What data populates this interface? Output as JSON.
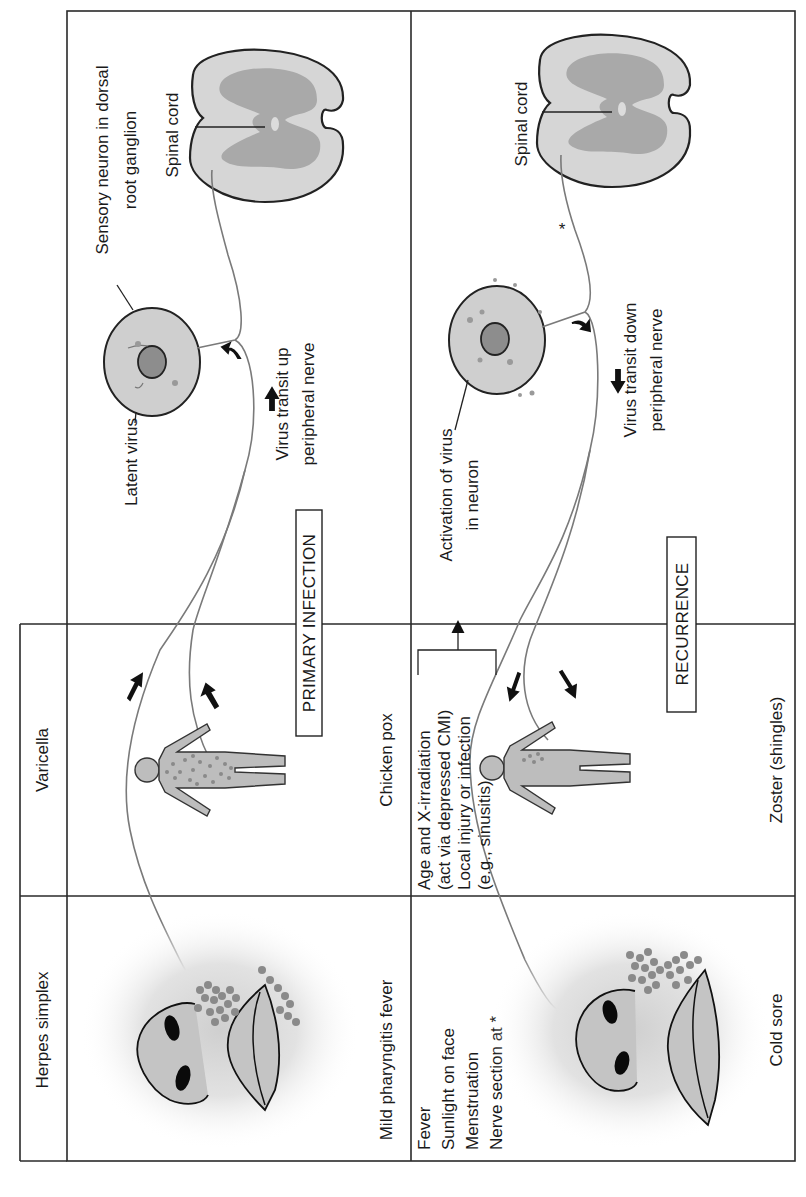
{
  "diagram": {
    "orientation": "rotated-90-ccw",
    "row_headers": {
      "herpes": "Herpes simplex",
      "varicella": "Varicella"
    },
    "section_labels": {
      "primary": "PRIMARY INFECTION",
      "recurrence": "RECURRENCE"
    },
    "primary": {
      "sensory_neuron": "Sensory neuron in dorsal",
      "sensory_neuron_line2": "root ganglion",
      "spinal_cord": "Spinal cord",
      "latent_virus": "Latent virus",
      "transit_up": "Virus transit up",
      "transit_up_line2": "peripheral nerve",
      "varicella_outcome": "Chicken pox",
      "herpes_outcome": "Mild pharyngitis fever"
    },
    "recurrence": {
      "spinal_cord": "Spinal cord",
      "nerve_section_marker": "*",
      "activation": "Activation of virus",
      "activation_line2": "in neuron",
      "transit_down": "Virus transit down",
      "transit_down_line2": "peripheral nerve",
      "varicella_triggers": [
        "Age and X-irradiation",
        "(act via depressed CMI)",
        "Local injury or infection",
        "(e.g., sinusitis)"
      ],
      "herpes_triggers": [
        "Fever",
        "Sunlight on face",
        "Menstruation",
        "Nerve section at *"
      ],
      "varicella_outcome": "Zoster (shingles)",
      "herpes_outcome": "Cold sore"
    },
    "colors": {
      "border": "#2a2a2a",
      "tissue_light": "#d6d6d6",
      "tissue_dark": "#a9a9a9",
      "nerve": "#7a7a7a",
      "lesion": "#8a8a8a"
    }
  }
}
